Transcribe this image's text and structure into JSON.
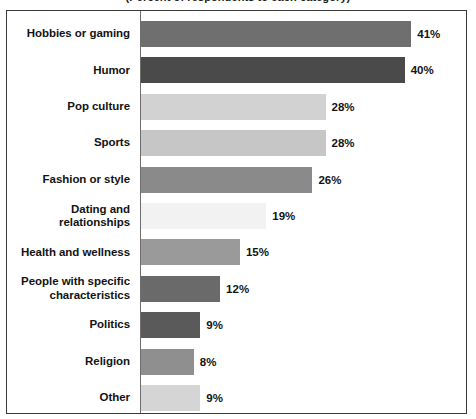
{
  "chart_title": "(Percent of respondents to each category)",
  "axis": {
    "category_axis_visible": true,
    "value_axis_visible": false,
    "gridlines": false
  },
  "chart_data": {
    "type": "bar",
    "orientation": "horizontal",
    "title": "(Percent of respondents to each category)",
    "xlabel": "",
    "ylabel": "",
    "xlim": [
      0,
      49
    ],
    "value_suffix": "%",
    "grid": false,
    "legend": "none",
    "categories": [
      "Hobbies or gaming",
      "Humor",
      "Pop culture",
      "Sports",
      "Fashion or style",
      "Dating and relationships",
      "Health and wellness",
      "People with specific characteristics",
      "Politics",
      "Religion",
      "Other"
    ],
    "values": [
      41,
      40,
      28,
      28,
      26,
      19,
      15,
      12,
      9,
      8,
      9
    ],
    "value_labels": [
      "41%",
      "40%",
      "28%",
      "28%",
      "26%",
      "19%",
      "15%",
      "12%",
      "9%",
      "8%",
      "9%"
    ],
    "bar_colors": [
      "#6f6f6f",
      "#4a4a4a",
      "#d2d2d2",
      "#c6c6c6",
      "#8a8a8a",
      "#f2f2f2",
      "#9a9a9a",
      "#6a6a6a",
      "#5a5a5a",
      "#8f8f8f",
      "#d5d5d5"
    ]
  },
  "rows": [
    {
      "label": "Hobbies or gaming",
      "label_line1": "Hobbies or gaming",
      "label_line2": "",
      "value": 41,
      "value_label": "41%",
      "color": "#6f6f6f"
    },
    {
      "label": "Humor",
      "label_line1": "Humor",
      "label_line2": "",
      "value": 40,
      "value_label": "40%",
      "color": "#4a4a4a"
    },
    {
      "label": "Pop culture",
      "label_line1": "Pop culture",
      "label_line2": "",
      "value": 28,
      "value_label": "28%",
      "color": "#d2d2d2"
    },
    {
      "label": "Sports",
      "label_line1": "Sports",
      "label_line2": "",
      "value": 28,
      "value_label": "28%",
      "color": "#c6c6c6"
    },
    {
      "label": "Fashion or style",
      "label_line1": "Fashion or style",
      "label_line2": "",
      "value": 26,
      "value_label": "26%",
      "color": "#8a8a8a"
    },
    {
      "label": "Dating and relationships",
      "label_line1": "Dating and relationships",
      "label_line2": "",
      "value": 19,
      "value_label": "19%",
      "color": "#f2f2f2"
    },
    {
      "label": "Health and wellness",
      "label_line1": "Health and wellness",
      "label_line2": "",
      "value": 15,
      "value_label": "15%",
      "color": "#9a9a9a"
    },
    {
      "label": "People with specific characteristics",
      "label_line1": "People with specific",
      "label_line2": "characteristics",
      "value": 12,
      "value_label": "12%",
      "color": "#6a6a6a"
    },
    {
      "label": "Politics",
      "label_line1": "Politics",
      "label_line2": "",
      "value": 9,
      "value_label": "9%",
      "color": "#5a5a5a"
    },
    {
      "label": "Religion",
      "label_line1": "Religion",
      "label_line2": "",
      "value": 8,
      "value_label": "8%",
      "color": "#8f8f8f"
    },
    {
      "label": "Other",
      "label_line1": "Other",
      "label_line2": "",
      "value": 9,
      "value_label": "9%",
      "color": "#d5d5d5"
    }
  ]
}
